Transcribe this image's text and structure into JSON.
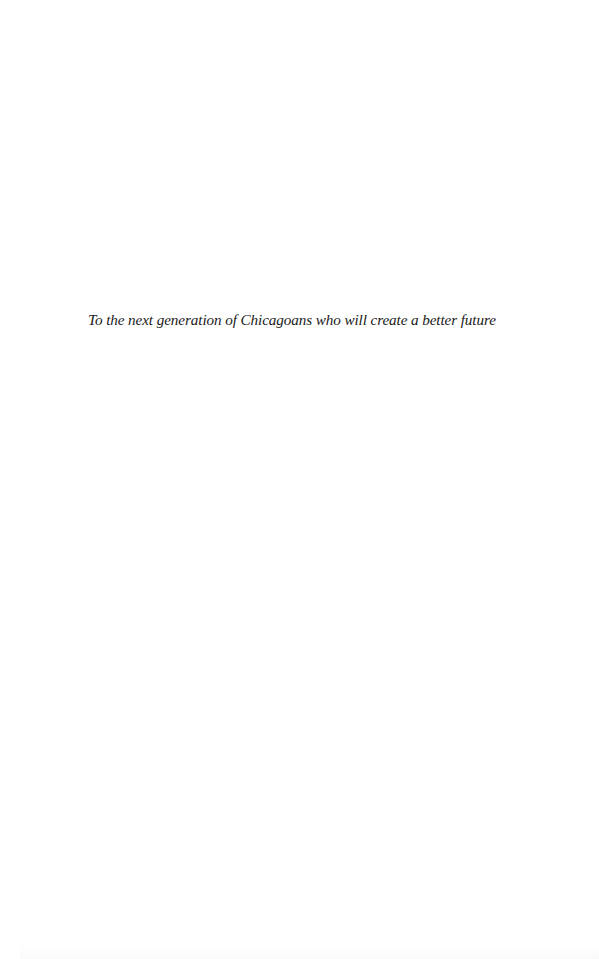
{
  "page": {
    "dedication": "To the next generation of Chicagoans who will create a better future"
  }
}
